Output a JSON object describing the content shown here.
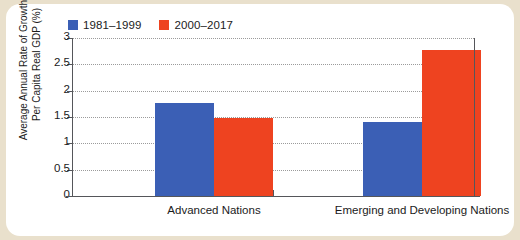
{
  "chart_data": {
    "type": "bar",
    "title": "",
    "xlabel": "",
    "ylabel": "Average Annual Rate of Growth of Per Capita Real GDP (%)",
    "ylabel_lines": [
      "Average Annual Rate of Growth of",
      "Per Capita Real GDP (%)"
    ],
    "categories": [
      "Advanced Nations",
      "Emerging and Developing Nations"
    ],
    "ylim": [
      0,
      3
    ],
    "yticks": [
      "0",
      "0.5",
      "1",
      "1.5",
      "2",
      "2.5",
      "3"
    ],
    "ytick_values": [
      0,
      0.5,
      1,
      1.5,
      2,
      2.5,
      3
    ],
    "grid": true,
    "legend_position": "top-left",
    "series": [
      {
        "name": "1981–1999",
        "color": "#3b5fb5",
        "values": [
          1.76,
          1.4
        ]
      },
      {
        "name": "2000–2017",
        "color": "#ee4320",
        "values": [
          1.48,
          2.77
        ]
      }
    ]
  },
  "figure": {
    "background": "#e9e0cc",
    "panel_background": "#ffffff",
    "axis_color": "#55565a",
    "grid_color": "#9b9b9b"
  }
}
